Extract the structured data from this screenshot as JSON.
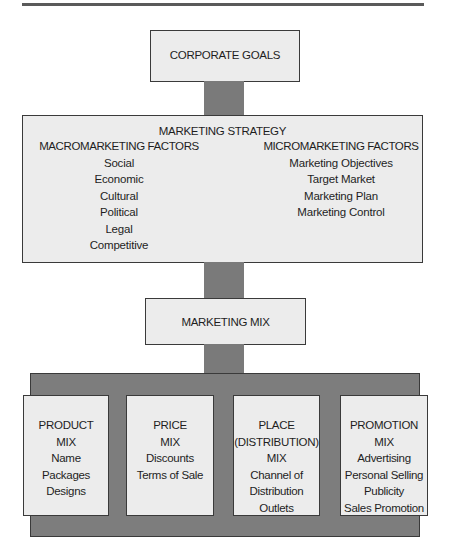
{
  "corporate_goals": {
    "label": "CORPORATE GOALS"
  },
  "marketing_strategy": {
    "title": "MARKETING STRATEGY",
    "macro": {
      "heading": "MACROMARKETING  FACTORS",
      "items": [
        "Social",
        "Economic",
        "Cultural",
        "Political",
        "Legal",
        "Competitive"
      ]
    },
    "micro": {
      "heading": "MICROMARKETING FACTORS",
      "items": [
        "Marketing Objectives",
        "Target Market",
        "Marketing Plan",
        "Marketing Control"
      ]
    }
  },
  "marketing_mix": {
    "label": "MARKETING MIX"
  },
  "mixes": [
    {
      "title": [
        "PRODUCT",
        "MIX"
      ],
      "items": [
        "Name",
        "Packages",
        "Designs"
      ]
    },
    {
      "title": [
        "PRICE",
        "MIX"
      ],
      "items": [
        "Discounts",
        "Terms of Sale"
      ]
    },
    {
      "title": [
        "PLACE",
        "(DISTRIBUTION)",
        "MIX"
      ],
      "items": [
        "Channel of",
        "Distribution",
        "Outlets"
      ]
    },
    {
      "title": [
        "PROMOTION",
        "MIX"
      ],
      "items": [
        "Advertising",
        "Personal Selling",
        "Publicity",
        "Sales Promotion"
      ]
    }
  ],
  "colors": {
    "box_fill": "#ececec",
    "connector": "#7a7a7a",
    "border": "#3a3a3a"
  }
}
